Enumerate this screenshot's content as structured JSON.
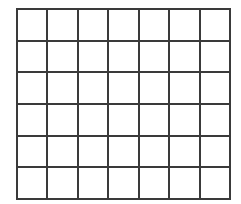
{
  "grid": {
    "rows": 6,
    "columns": 7,
    "line_color": "#3a3a3a",
    "fill_color": "#ffffff"
  }
}
